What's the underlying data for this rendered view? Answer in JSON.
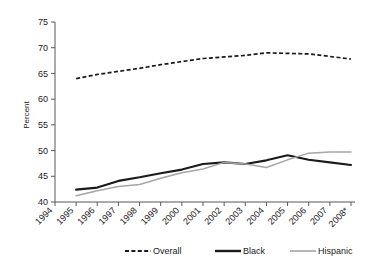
{
  "chart_data": {
    "type": "line",
    "title": "",
    "xlabel": "",
    "ylabel": "Percent",
    "ylim": [
      40,
      75
    ],
    "ytick_step": 5,
    "yticks": [
      "40",
      "45",
      "50",
      "55",
      "60",
      "65",
      "70",
      "75"
    ],
    "grid": false,
    "legend_position": "bottom",
    "categories": [
      "1994",
      "1995",
      "1996",
      "1997",
      "1998",
      "1999",
      "2000",
      "2001",
      "2002",
      "2003",
      "2004",
      "2005",
      "2006",
      "2007",
      "2008*"
    ],
    "x": [
      1994,
      1995,
      1996,
      1997,
      1998,
      1999,
      2000,
      2001,
      2002,
      2003,
      2004,
      2005,
      2006,
      2007,
      2008
    ],
    "series": [
      {
        "name": "Overall",
        "style": "dashed",
        "color": "#1a1a1a",
        "x": [
          1995,
          1996,
          1997,
          1998,
          1999,
          2000,
          2001,
          2002,
          2003,
          2004,
          2005,
          2006,
          2007,
          2008
        ],
        "values": [
          64.0,
          64.8,
          65.4,
          66.0,
          66.7,
          67.3,
          67.9,
          68.2,
          68.5,
          69.0,
          68.9,
          68.8,
          68.3,
          67.8
        ]
      },
      {
        "name": "Black",
        "style": "solid-thick",
        "color": "#1a1a1a",
        "x": [
          1995,
          1996,
          1997,
          1998,
          1999,
          2000,
          2001,
          2002,
          2003,
          2004,
          2005,
          2006,
          2007,
          2008
        ],
        "values": [
          42.4,
          42.8,
          44.1,
          44.8,
          45.6,
          46.3,
          47.4,
          47.7,
          47.4,
          48.1,
          49.1,
          48.2,
          47.7,
          47.2
        ]
      },
      {
        "name": "Hispanic",
        "style": "solid-thin",
        "color": "#a6a6a6",
        "x": [
          1995,
          1996,
          1997,
          1998,
          1999,
          2000,
          2001,
          2002,
          2003,
          2004,
          2005,
          2006,
          2007,
          2008
        ],
        "values": [
          41.2,
          42.2,
          43.0,
          43.4,
          44.6,
          45.7,
          46.4,
          47.7,
          47.4,
          46.7,
          48.2,
          49.5,
          49.7,
          49.7
        ]
      }
    ],
    "legend": [
      {
        "label": "Overall",
        "style": "dashed",
        "color": "#1a1a1a"
      },
      {
        "label": "Black",
        "style": "solid-thick",
        "color": "#1a1a1a"
      },
      {
        "label": "Hispanic",
        "style": "solid-thin",
        "color": "#a6a6a6"
      }
    ]
  }
}
